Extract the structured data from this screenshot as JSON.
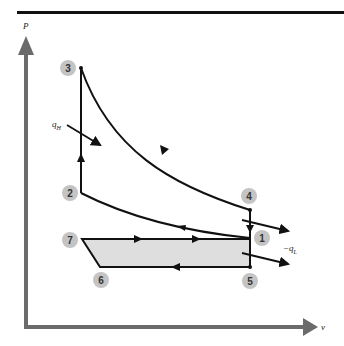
{
  "diagram": {
    "axes": {
      "y_label": "P",
      "x_label": "v",
      "color": "#6b6b6b"
    },
    "states": [
      {
        "id": "1",
        "label": "1"
      },
      {
        "id": "2",
        "label": "2"
      },
      {
        "id": "3",
        "label": "3"
      },
      {
        "id": "4",
        "label": "4"
      },
      {
        "id": "5",
        "label": "5"
      },
      {
        "id": "6",
        "label": "6"
      },
      {
        "id": "7",
        "label": "7"
      }
    ],
    "heat_labels": {
      "heat_in": "q",
      "heat_in_sub": "H",
      "heat_out_prefix": "−q",
      "heat_out_sub": "L"
    },
    "colors": {
      "line": "#111111",
      "shaded_region": "#dedede",
      "state_circle": "#c4c4c4",
      "top_rule": "#111111"
    }
  }
}
